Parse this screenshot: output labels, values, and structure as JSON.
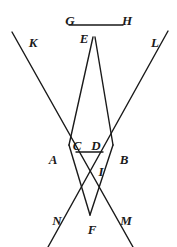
{
  "figure": {
    "kind": "geometry-diagram",
    "width": 177,
    "height": 247,
    "background_color": "#ffffff",
    "stroke_color": "#1a1a1a",
    "stroke_width": 1.4,
    "labels": [
      {
        "id": "G",
        "text": "G",
        "x": 70,
        "y": 20
      },
      {
        "id": "H",
        "text": "H",
        "x": 127,
        "y": 20
      },
      {
        "id": "K",
        "text": "K",
        "x": 33,
        "y": 42
      },
      {
        "id": "L",
        "text": "L",
        "x": 155,
        "y": 42
      },
      {
        "id": "E",
        "text": "E",
        "x": 84,
        "y": 38
      },
      {
        "id": "C",
        "text": "C",
        "x": 77,
        "y": 145
      },
      {
        "id": "D",
        "text": "D",
        "x": 96,
        "y": 145
      },
      {
        "id": "A",
        "text": "A",
        "x": 53,
        "y": 159
      },
      {
        "id": "B",
        "text": "B",
        "x": 124,
        "y": 159
      },
      {
        "id": "I",
        "text": "I",
        "x": 101,
        "y": 171
      },
      {
        "id": "N",
        "text": "N",
        "x": 57,
        "y": 220
      },
      {
        "id": "F",
        "text": "F",
        "x": 92,
        "y": 229
      },
      {
        "id": "M",
        "text": "M",
        "x": 126,
        "y": 220
      }
    ],
    "segments": [
      {
        "id": "GH",
        "name": "segment-gh",
        "x1": 69,
        "y1": 25,
        "x2": 123,
        "y2": 25
      },
      {
        "id": "CD",
        "name": "segment-cd",
        "x1": 76,
        "y1": 152,
        "x2": 103,
        "y2": 152
      },
      {
        "id": "KM",
        "name": "line-k-to-m",
        "x1": 12,
        "y1": 32,
        "x2": 133,
        "y2": 247
      },
      {
        "id": "LN",
        "name": "line-l-to-n",
        "x1": 168,
        "y1": 31,
        "x2": 48,
        "y2": 247
      },
      {
        "id": "EA",
        "name": "line-e-to-f-left",
        "x1": 93,
        "y1": 37,
        "x2": 69,
        "y2": 145
      },
      {
        "id": "EB",
        "name": "line-e-to-f-right",
        "x1": 95,
        "y1": 37,
        "x2": 113,
        "y2": 145
      },
      {
        "id": "AF",
        "name": "segment-a-to-f",
        "x1": 69,
        "y1": 145,
        "x2": 90,
        "y2": 215
      },
      {
        "id": "BF",
        "name": "segment-b-to-f",
        "x1": 113,
        "y1": 145,
        "x2": 90,
        "y2": 215
      }
    ]
  }
}
